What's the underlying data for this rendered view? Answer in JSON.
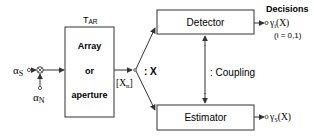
{
  "inputs": {
    "signal": {
      "symbol": "α",
      "subscript": "S"
    },
    "noise": {
      "symbol": "α",
      "subscript": "N"
    }
  },
  "array_block": {
    "label_main": "T",
    "label_sub": "AR",
    "lines": [
      "Array",
      "or",
      "aperture"
    ]
  },
  "array_output": {
    "main": "[X",
    "sub": "n",
    "close": "]"
  },
  "split_label": ": X",
  "detector": {
    "label": "Detector"
  },
  "estimator": {
    "label": "Estimator"
  },
  "coupling_label": ": Coupling",
  "decisions": {
    "heading": "Decisions",
    "detector_output_main": "γ",
    "detector_output_sub": "i",
    "detector_output_tail": "(X)",
    "detector_index_note": "(i = 0,1)",
    "estimator_output_main": "γ",
    "estimator_output_sub": "S",
    "estimator_output_tail": "(X)"
  }
}
